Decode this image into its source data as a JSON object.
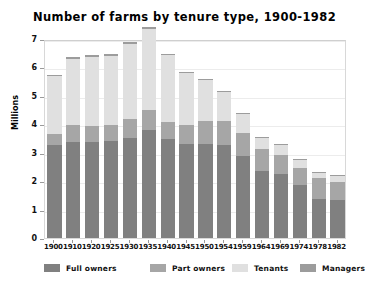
{
  "chart_data": {
    "type": "bar",
    "subtype": "stacked-vertical",
    "title": "Number of farms by tenure type, 1900-1982",
    "xlabel": "",
    "ylabel": "Millions",
    "ylim": [
      0,
      7
    ],
    "yticks": [
      0,
      1,
      2,
      3,
      4,
      5,
      6,
      7
    ],
    "grid": true,
    "legend_position": "bottom",
    "categories": [
      "1900",
      "1910",
      "1920",
      "1925",
      "1930",
      "1935",
      "1940",
      "1945",
      "1950",
      "1954",
      "1959",
      "1964",
      "1969",
      "1974",
      "1978",
      "1982"
    ],
    "series": [
      {
        "name": "Full owners",
        "color": "#808080",
        "values": [
          3.27,
          3.37,
          3.37,
          3.4,
          3.52,
          3.8,
          3.47,
          3.3,
          3.3,
          3.28,
          2.88,
          2.36,
          2.26,
          1.85,
          1.38,
          1.33
        ]
      },
      {
        "name": "Part owners",
        "color": "#a6a6a6",
        "values": [
          0.4,
          0.59,
          0.56,
          0.56,
          0.66,
          0.69,
          0.62,
          0.66,
          0.82,
          0.82,
          0.81,
          0.77,
          0.67,
          0.63,
          0.72,
          0.65
        ]
      },
      {
        "name": "Tenants",
        "color": "#e0e0e0",
        "values": [
          2.02,
          2.35,
          2.45,
          2.45,
          2.66,
          2.87,
          2.36,
          1.86,
          1.44,
          1.05,
          0.7,
          0.43,
          0.35,
          0.29,
          0.22,
          0.22
        ]
      },
      {
        "name": "Managers",
        "color": "#9c9c9c",
        "values": [
          0.06,
          0.06,
          0.07,
          0.06,
          0.06,
          0.05,
          0.04,
          0.03,
          0.02,
          0.02,
          0.02,
          0.01,
          0.01,
          0.01,
          0.01,
          0.01
        ]
      }
    ],
    "totals": [
      5.74,
      6.36,
      6.45,
      6.46,
      6.9,
      6.81,
      6.35,
      5.86,
      5.38,
      4.78,
      3.71,
      3.16,
      2.73,
      2.31,
      2.23,
      2.2
    ]
  },
  "colors": {
    "full_owners": "#808080",
    "part_owners": "#a6a6a6",
    "tenants": "#e0e0e0",
    "managers": "#9c9c9c",
    "frame": "#d8d8d8",
    "grid": "#ececec",
    "text": "#000000",
    "background": "#ffffff"
  },
  "axis": {
    "y_label": "Millions",
    "y_tick_labels": [
      "7",
      "6",
      "5",
      "4",
      "3",
      "2",
      "1",
      "0"
    ]
  },
  "legend": {
    "items": [
      {
        "label": "Full owners",
        "color": "#808080"
      },
      {
        "label": "Part owners",
        "color": "#a6a6a6"
      },
      {
        "label": "Tenants",
        "color": "#e0e0e0"
      },
      {
        "label": "Managers",
        "color": "#9c9c9c"
      }
    ]
  }
}
